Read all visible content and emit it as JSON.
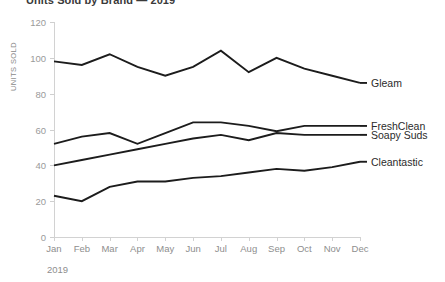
{
  "chart_data": {
    "type": "line",
    "title": "Units Sold by Brand — 2019",
    "xlabel": "2019",
    "ylabel": "UNITS SOLD",
    "categories": [
      "Jan",
      "Feb",
      "Mar",
      "Apr",
      "May",
      "Jun",
      "Jul",
      "Aug",
      "Sep",
      "Oct",
      "Nov",
      "Dec"
    ],
    "yticks": [
      0,
      20,
      40,
      60,
      80,
      100,
      120
    ],
    "ylim": [
      0,
      120
    ],
    "grid": false,
    "legend_position": "right-of-line-end",
    "line_color": "#1c1c1c",
    "series": [
      {
        "name": "Gleam",
        "values": [
          98,
          96,
          102,
          95,
          90,
          95,
          104,
          92,
          100,
          94,
          90,
          86
        ]
      },
      {
        "name": "FreshClean",
        "values": [
          52,
          56,
          58,
          52,
          58,
          64,
          64,
          62,
          59,
          62,
          62,
          62
        ]
      },
      {
        "name": "Soapy Suds",
        "values": [
          40,
          43,
          46,
          49,
          52,
          55,
          57,
          54,
          58,
          57,
          57,
          57
        ]
      },
      {
        "name": "Cleantastic",
        "values": [
          23,
          20,
          28,
          31,
          31,
          33,
          34,
          36,
          38,
          37,
          39,
          42
        ]
      }
    ]
  }
}
